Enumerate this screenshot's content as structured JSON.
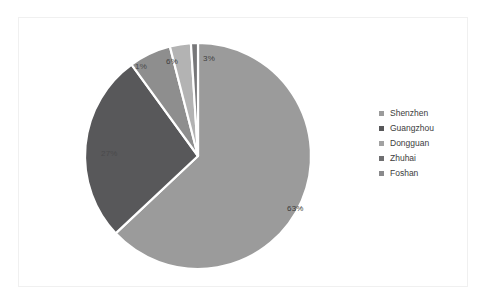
{
  "chart_data": {
    "type": "pie",
    "title": "",
    "categories": [
      "Shenzhen",
      "Guangzhou",
      "Dongguan",
      "Zhuhai",
      "Foshan"
    ],
    "values": [
      63,
      27,
      6,
      3,
      1
    ],
    "value_labels": [
      "63%",
      "27%",
      "6%",
      "3%",
      "1%"
    ],
    "colors": [
      "#9b9b9b",
      "#58585a",
      "#8e8e8e",
      "#b3b3b3",
      "#777779"
    ],
    "start_angle_deg": 0,
    "direction": "clockwise",
    "legend_position": "right",
    "grid": false,
    "slice_gap_color": "#ffffff"
  },
  "legend": {
    "items": [
      {
        "label": "Shenzhen",
        "color": "#9b9b9b"
      },
      {
        "label": "Guangzhou",
        "color": "#58585a"
      },
      {
        "label": "Dongguan",
        "color": "#a2a2a2"
      },
      {
        "label": "Zhuhai",
        "color": "#6f6f71"
      },
      {
        "label": "Foshan",
        "color": "#8a8a8c"
      }
    ]
  },
  "labels": {
    "shenzhen": "63%",
    "guangzhou": "27%",
    "dongguan": "6%",
    "zhuhai": "3%",
    "foshan": "1%"
  }
}
